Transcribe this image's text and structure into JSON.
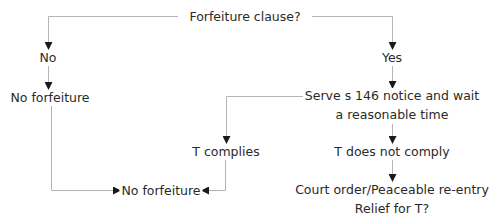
{
  "diagram": {
    "type": "flowchart",
    "line_color": "#b5b5b5",
    "arrow_color": "#1a1a1a",
    "text_color": "#2a2a2a",
    "nodes": {
      "root": "Forfeiture clause?",
      "no": "No",
      "no_forfeiture_left": "No forfeiture",
      "yes": "Yes",
      "serve_line1": "Serve s 146 notice and wait",
      "serve_line2": "a reasonable time",
      "t_complies": "T complies",
      "t_not_comply": "T does not comply",
      "no_forfeiture_bottom": "No forfeiture",
      "court_line1": "Court order/Peaceable re-entry",
      "court_line2": "Relief for T?"
    },
    "edges": [
      {
        "from": "Forfeiture clause?",
        "to": "No"
      },
      {
        "from": "Forfeiture clause?",
        "to": "Yes"
      },
      {
        "from": "No",
        "to": "No forfeiture"
      },
      {
        "from": "No forfeiture",
        "to": "No forfeiture (bottom)"
      },
      {
        "from": "Yes",
        "to": "Serve s 146 notice and wait a reasonable time"
      },
      {
        "from": "Serve s 146 notice and wait a reasonable time",
        "to": "T complies"
      },
      {
        "from": "Serve s 146 notice and wait a reasonable time",
        "to": "T does not comply"
      },
      {
        "from": "T complies",
        "to": "No forfeiture (bottom)"
      },
      {
        "from": "T does not comply",
        "to": "Court order/Peaceable re-entry / Relief for T?"
      }
    ]
  }
}
